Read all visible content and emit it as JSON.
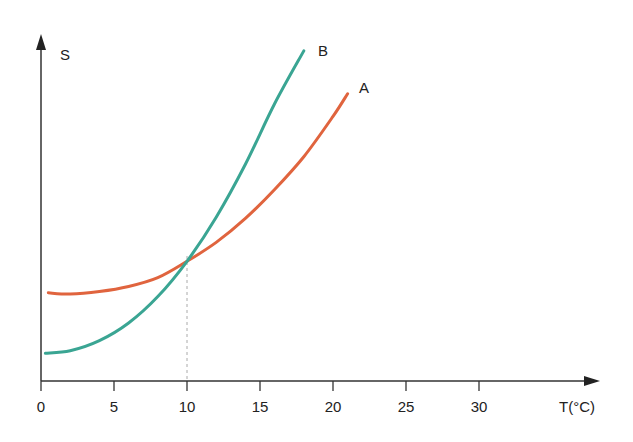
{
  "chart_data": {
    "type": "line",
    "title": "",
    "xlabel": "T(°C)",
    "ylabel": "S",
    "xlim": [
      0,
      38
    ],
    "x_ticks": [
      "0",
      "5",
      "10",
      "15",
      "20",
      "25",
      "30"
    ],
    "grid": false,
    "y_ticks": [],
    "annotations": [
      {
        "type": "dashed-vertical-line",
        "x": 10,
        "note": "intersection of A and B"
      }
    ],
    "series": [
      {
        "name": "A",
        "color": "#e0643e",
        "x": [
          0.5,
          2,
          4,
          6,
          8,
          10,
          12,
          14,
          16,
          18,
          20,
          21
        ],
        "y": [
          3.5,
          3.45,
          3.55,
          3.75,
          4.1,
          4.75,
          5.5,
          6.45,
          7.6,
          8.9,
          10.5,
          11.4
        ]
      },
      {
        "name": "B",
        "color": "#3aa593",
        "x": [
          0.3,
          2,
          4,
          6,
          8,
          10,
          12,
          14,
          16,
          18
        ],
        "y": [
          1.1,
          1.2,
          1.6,
          2.3,
          3.35,
          4.75,
          6.5,
          8.6,
          11.0,
          13.1
        ]
      }
    ]
  },
  "labels": {
    "y_axis": "S",
    "x_axis": "T(°C)",
    "curve_a": "A",
    "curve_b": "B"
  }
}
